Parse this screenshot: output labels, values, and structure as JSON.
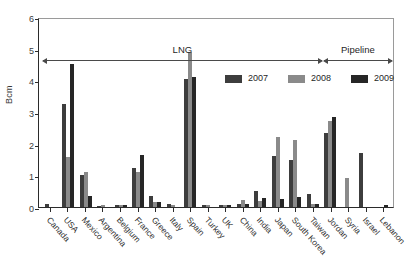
{
  "chart_data": {
    "type": "bar",
    "title": "",
    "xlabel": "",
    "ylabel": "Bcm",
    "ylim": [
      0,
      6
    ],
    "yticks": [
      0,
      1,
      2,
      3,
      4,
      5,
      6
    ],
    "grid": false,
    "legend_position": "upper-right-inside",
    "categories": [
      "Canada",
      "USA",
      "Mexico",
      "Argentina",
      "Belgium",
      "France",
      "Greece",
      "Italy",
      "Spain",
      "Turkey",
      "UK",
      "China",
      "India",
      "Japan",
      "South Korea",
      "Taiwan",
      "Jordan",
      "Syria",
      "Israel",
      "Lebanon"
    ],
    "series": [
      {
        "name": "2007",
        "color": "#3d3d3d",
        "values": [
          0.08,
          3.25,
          1.0,
          0.04,
          0.07,
          1.22,
          0.35,
          0.08,
          4.05,
          0.05,
          0.06,
          0.1,
          0.52,
          1.62,
          1.48,
          0.4,
          2.35,
          0.0,
          1.7,
          0.0
        ]
      },
      {
        "name": "2008",
        "color": "#8a8a8a",
        "values": [
          0.0,
          1.58,
          1.1,
          0.05,
          0.07,
          1.1,
          0.17,
          0.07,
          4.9,
          0.06,
          0.06,
          0.22,
          0.2,
          2.22,
          2.13,
          0.1,
          2.72,
          0.92,
          0.0,
          0.0
        ]
      },
      {
        "name": "2009",
        "color": "#262626",
        "values": [
          0.0,
          4.53,
          0.35,
          0.0,
          0.07,
          1.65,
          0.17,
          0.0,
          4.1,
          0.0,
          0.06,
          0.1,
          0.28,
          0.25,
          0.32,
          0.08,
          2.85,
          0.0,
          0.0,
          0.06
        ]
      }
    ],
    "annotations": [
      {
        "label": "LNG",
        "from_category": "Canada",
        "to_category": "Taiwan"
      },
      {
        "label": "Pipeline",
        "from_category": "Jordan",
        "to_category": "Lebanon"
      }
    ]
  }
}
